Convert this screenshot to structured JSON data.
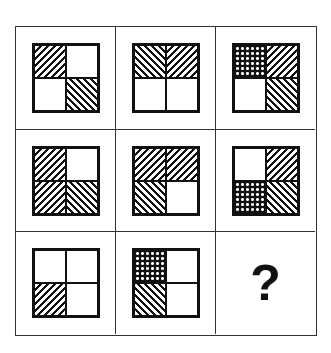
{
  "puzzle": {
    "description": "3x3 figure-reasoning matrix; each cell is a square split into 4 quadrants with fill patterns",
    "legend": {
      "empty": "blank white quadrant",
      "fwd": "forward diagonal hatching (/)",
      "back": "backward diagonal hatching (\\)",
      "cross": "crosshatch / dotted mesh"
    },
    "cells": [
      {
        "row": 0,
        "col": 0,
        "quadrants": {
          "tl": "fwd",
          "tr": "empty",
          "bl": "empty",
          "br": "back"
        }
      },
      {
        "row": 0,
        "col": 1,
        "quadrants": {
          "tl": "back",
          "tr": "fwd",
          "bl": "empty",
          "br": "empty"
        }
      },
      {
        "row": 0,
        "col": 2,
        "quadrants": {
          "tl": "cross",
          "tr": "fwd",
          "bl": "empty",
          "br": "back"
        }
      },
      {
        "row": 1,
        "col": 0,
        "quadrants": {
          "tl": "fwd",
          "tr": "empty",
          "bl": "fwd",
          "br": "back"
        }
      },
      {
        "row": 1,
        "col": 1,
        "quadrants": {
          "tl": "fwd",
          "tr": "fwd",
          "bl": "back",
          "br": "empty"
        }
      },
      {
        "row": 1,
        "col": 2,
        "quadrants": {
          "tl": "empty",
          "tr": "fwd",
          "bl": "cross",
          "br": "back"
        }
      },
      {
        "row": 2,
        "col": 0,
        "quadrants": {
          "tl": "empty",
          "tr": "empty",
          "bl": "fwd",
          "br": "empty"
        }
      },
      {
        "row": 2,
        "col": 1,
        "quadrants": {
          "tl": "cross",
          "tr": "empty",
          "bl": "back",
          "br": "empty"
        }
      },
      {
        "row": 2,
        "col": 2,
        "unknown": true,
        "label": "?"
      }
    ]
  },
  "colors": {
    "line": "#111111",
    "grid": "#333333",
    "background": "#ffffff"
  }
}
